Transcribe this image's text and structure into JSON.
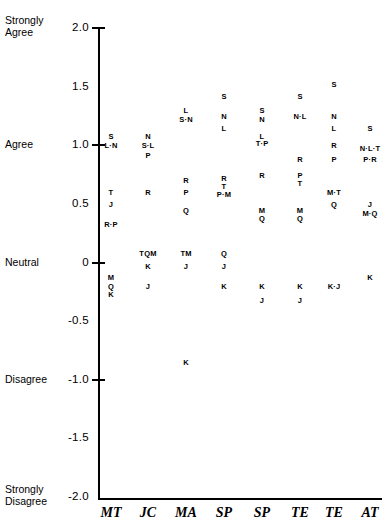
{
  "chart_data": {
    "type": "scatter",
    "title": "",
    "xlabel": "",
    "ylabel": "",
    "ylim": [
      -2.0,
      2.0
    ],
    "grid": false,
    "legend": "none",
    "point_label_note": "Each plotted mark is a letter code for a respondent group; dotted pairs such as 'L·N' mean two codes share the same value.",
    "y_axis": {
      "ticks": [
        {
          "value": 2.0,
          "label": "2.0",
          "anchor": "Strongly\nAgree"
        },
        {
          "value": 1.5,
          "label": "1.5",
          "anchor": ""
        },
        {
          "value": 1.0,
          "label": "1.0",
          "anchor": "Agree"
        },
        {
          "value": 0.5,
          "label": "0.5",
          "anchor": ""
        },
        {
          "value": 0.0,
          "label": "0",
          "anchor": "Neutral"
        },
        {
          "value": -0.5,
          "label": "-0.5",
          "anchor": ""
        },
        {
          "value": -1.0,
          "label": "-1.0",
          "anchor": "Disagree"
        },
        {
          "value": -1.5,
          "label": "-1.5",
          "anchor": ""
        },
        {
          "value": -2.0,
          "label": "-2.0",
          "anchor": "Strongly\nDisagree"
        }
      ]
    },
    "categories": [
      "MT",
      "JC",
      "MA",
      "SP",
      "SP",
      "TE",
      "TE",
      "AT"
    ],
    "columns": [
      {
        "category": "MT",
        "points": [
          {
            "label": "S",
            "value": 1.08
          },
          {
            "label": "L·N",
            "value": 1.0
          },
          {
            "label": "T",
            "value": 0.6
          },
          {
            "label": "J",
            "value": 0.5
          },
          {
            "label": "R·P",
            "value": 0.33
          },
          {
            "label": "M",
            "value": -0.12
          },
          {
            "label": "Q",
            "value": -0.2
          },
          {
            "label": "K",
            "value": -0.27
          }
        ]
      },
      {
        "category": "JC",
        "points": [
          {
            "label": "N",
            "value": 1.08
          },
          {
            "label": "S·L",
            "value": 1.0
          },
          {
            "label": "P",
            "value": 0.92
          },
          {
            "label": "R",
            "value": 0.6
          },
          {
            "label": "TQM",
            "value": 0.08
          },
          {
            "label": "K",
            "value": -0.03
          },
          {
            "label": "J",
            "value": -0.2
          }
        ]
      },
      {
        "category": "MA",
        "points": [
          {
            "label": "L",
            "value": 1.3
          },
          {
            "label": "S·N",
            "value": 1.22
          },
          {
            "label": "R",
            "value": 0.7
          },
          {
            "label": "P",
            "value": 0.6
          },
          {
            "label": "Q",
            "value": 0.45
          },
          {
            "label": "TM",
            "value": 0.08
          },
          {
            "label": "J",
            "value": -0.03
          },
          {
            "label": "K",
            "value": -0.85
          }
        ]
      },
      {
        "category": "SP",
        "points": [
          {
            "label": "S",
            "value": 1.42
          },
          {
            "label": "N",
            "value": 1.25
          },
          {
            "label": "L",
            "value": 1.15
          },
          {
            "label": "R",
            "value": 0.72
          },
          {
            "label": "T",
            "value": 0.65
          },
          {
            "label": "P·M",
            "value": 0.58
          },
          {
            "label": "Q",
            "value": 0.08
          },
          {
            "label": "J",
            "value": -0.03
          },
          {
            "label": "K",
            "value": -0.2
          }
        ]
      },
      {
        "category": "SP",
        "points": [
          {
            "label": "S",
            "value": 1.3
          },
          {
            "label": "N",
            "value": 1.22
          },
          {
            "label": "L",
            "value": 1.08
          },
          {
            "label": "T·P",
            "value": 1.02
          },
          {
            "label": "R",
            "value": 0.75
          },
          {
            "label": "M",
            "value": 0.45
          },
          {
            "label": "Q",
            "value": 0.38
          },
          {
            "label": "K",
            "value": -0.2
          },
          {
            "label": "J",
            "value": -0.32
          }
        ]
      },
      {
        "category": "TE",
        "points": [
          {
            "label": "S",
            "value": 1.42
          },
          {
            "label": "N·L",
            "value": 1.25
          },
          {
            "label": "R",
            "value": 0.88
          },
          {
            "label": "P",
            "value": 0.75
          },
          {
            "label": "T",
            "value": 0.68
          },
          {
            "label": "M",
            "value": 0.45
          },
          {
            "label": "Q",
            "value": 0.38
          },
          {
            "label": "K",
            "value": -0.2
          },
          {
            "label": "J",
            "value": -0.32
          }
        ]
      },
      {
        "category": "TE",
        "points": [
          {
            "label": "S",
            "value": 1.52
          },
          {
            "label": "N",
            "value": 1.25
          },
          {
            "label": "L",
            "value": 1.15
          },
          {
            "label": "R",
            "value": 1.0
          },
          {
            "label": "P",
            "value": 0.88
          },
          {
            "label": "M·T",
            "value": 0.6
          },
          {
            "label": "Q",
            "value": 0.5
          },
          {
            "label": "K·J",
            "value": -0.2
          }
        ]
      },
      {
        "category": "AT",
        "points": [
          {
            "label": "S",
            "value": 1.15
          },
          {
            "label": "N·L·T",
            "value": 0.98
          },
          {
            "label": "P·R",
            "value": 0.88
          },
          {
            "label": "J",
            "value": 0.5
          },
          {
            "label": "M·Q",
            "value": 0.42
          },
          {
            "label": "K",
            "value": -0.12
          }
        ]
      }
    ]
  }
}
